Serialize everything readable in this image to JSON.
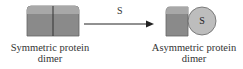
{
  "diagram": {
    "left": {
      "caption_line1": "Symmetric protein",
      "caption_line2": "dimer"
    },
    "arrow": {
      "label": "S"
    },
    "right": {
      "caption_line1": "Asymmetric protein",
      "caption_line2": "dimer",
      "ligand_label": "S"
    },
    "colors": {
      "subunit_fill": "#8a8a8a",
      "subunit_top": "#b0b0b0",
      "ligand_fill": "#bdbdbd",
      "outline": "#555555",
      "arrow": "#222222"
    }
  }
}
